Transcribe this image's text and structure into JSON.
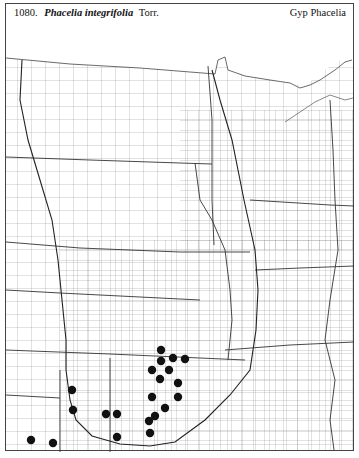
{
  "header": {
    "number": "1080.",
    "scientific_name": "Phacelia integrifolia",
    "author": "Torr.",
    "common_name": "Gyp Phacelia"
  },
  "map": {
    "region": "Great Plains & Upper Midwest county outline map",
    "line_color": "#555555",
    "dot_color": "#111111",
    "occurrence_dots": [
      {
        "x": 161,
        "y": 350
      },
      {
        "x": 161,
        "y": 361
      },
      {
        "x": 173,
        "y": 358
      },
      {
        "x": 185,
        "y": 359
      },
      {
        "x": 152,
        "y": 370
      },
      {
        "x": 169,
        "y": 370
      },
      {
        "x": 160,
        "y": 379
      },
      {
        "x": 178,
        "y": 383
      },
      {
        "x": 152,
        "y": 397
      },
      {
        "x": 178,
        "y": 397
      },
      {
        "x": 165,
        "y": 408
      },
      {
        "x": 155,
        "y": 416
      },
      {
        "x": 149,
        "y": 421
      },
      {
        "x": 150,
        "y": 433
      },
      {
        "x": 72,
        "y": 390
      },
      {
        "x": 73,
        "y": 410
      },
      {
        "x": 106,
        "y": 414
      },
      {
        "x": 117,
        "y": 414
      },
      {
        "x": 117,
        "y": 437
      },
      {
        "x": 31,
        "y": 440
      },
      {
        "x": 53,
        "y": 443
      }
    ]
  }
}
